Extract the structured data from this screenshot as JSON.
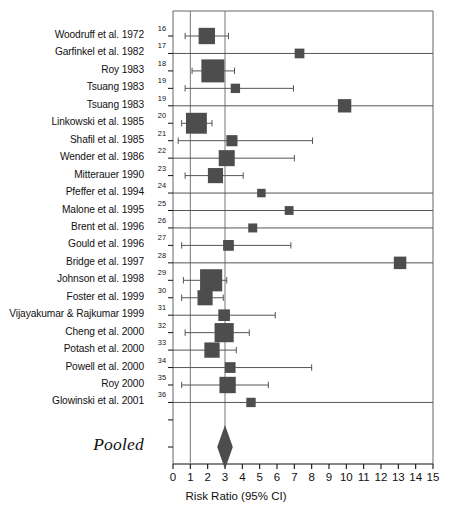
{
  "figure": {
    "kind": "forest-plot",
    "background": "#ffffff",
    "marker_color": "#4d4d4d",
    "line_color": "#555555",
    "frame_color": "#666666",
    "reference_line_color": "#777777"
  },
  "axis": {
    "title": "Risk Ratio (95% CI)",
    "min": 0,
    "max": 15,
    "ticks": [
      0,
      1,
      2,
      3,
      4,
      5,
      6,
      7,
      8,
      9,
      10,
      11,
      12,
      13,
      14,
      15
    ],
    "tick_labels": [
      "0",
      "1",
      "2",
      "3",
      "4",
      "5",
      "6",
      "7",
      "8",
      "9",
      "10",
      "11",
      "12",
      "13",
      "14",
      "15"
    ],
    "reference_lines": [
      1,
      3
    ]
  },
  "pooled": {
    "label": "Pooled",
    "estimate": 3.0,
    "ci_low": 2.55,
    "ci_high": 3.45
  },
  "chart_data": {
    "type": "scatter",
    "title": "",
    "xlabel": "Risk Ratio (95% CI)",
    "ylabel": "",
    "xlim": [
      0,
      15
    ],
    "grid": false,
    "legend": "none",
    "categories": [
      "Woodruff et al. 1972",
      "Garfinkel et al. 1982",
      "Roy 1983",
      "Tsuang 1983",
      "Tsuang 1983",
      "Linkowski et al. 1985",
      "Shafil et al. 1985",
      "Wender et al. 1986",
      "Mitterauer 1990",
      "Pfeffer et al. 1994",
      "Malone et al. 1995",
      "Brent et al. 1996",
      "Gould et al. 1996",
      "Bridge et al. 1997",
      "Johnson et al. 1998",
      "Foster et al. 1999",
      "Vijayakumar & Rajkumar 1999",
      "Cheng et al. 2000",
      "Potash et al. 2000",
      "Powell et al. 2000",
      "Roy 2000",
      "Glowinski et al. 2001"
    ],
    "rows": [
      {
        "label": "Woodruff et al. 1972",
        "ref": "16",
        "rr": 1.95,
        "ci_low": 0.7,
        "ci_high": 3.2,
        "weight": 0.62
      },
      {
        "label": "Garfinkel et al. 1982",
        "ref": "17",
        "rr": 7.3,
        "ci_low": 0.0,
        "ci_high": 15.0,
        "weight": 0.24
      },
      {
        "label": "Roy 1983",
        "ref": "18",
        "rr": 2.3,
        "ci_low": 1.1,
        "ci_high": 3.55,
        "weight": 1.0
      },
      {
        "label": "Tsuang 1983",
        "ref": "19",
        "rr": 3.6,
        "ci_low": 0.7,
        "ci_high": 6.95,
        "weight": 0.22
      },
      {
        "label": "Tsuang 1983",
        "ref": "19",
        "rr": 9.9,
        "ci_low": 0.0,
        "ci_high": 15.0,
        "weight": 0.45
      },
      {
        "label": "Linkowski et al. 1985",
        "ref": "20",
        "rr": 1.35,
        "ci_low": 0.5,
        "ci_high": 2.25,
        "weight": 0.88
      },
      {
        "label": "Shafil et al. 1985",
        "ref": "21",
        "rr": 3.4,
        "ci_low": 0.3,
        "ci_high": 8.05,
        "weight": 0.32
      },
      {
        "label": "Wender et al. 1986",
        "ref": "22",
        "rr": 3.1,
        "ci_low": 0.0,
        "ci_high": 7.0,
        "weight": 0.6
      },
      {
        "label": "Mitterauer 1990",
        "ref": "23",
        "rr": 2.45,
        "ci_low": 0.7,
        "ci_high": 4.05,
        "weight": 0.55
      },
      {
        "label": "Pfeffer et al. 1994",
        "ref": "24",
        "rr": 5.1,
        "ci_low": 0.0,
        "ci_high": 15.0,
        "weight": 0.17
      },
      {
        "label": "Malone et al. 1995",
        "ref": "25",
        "rr": 6.7,
        "ci_low": 0.0,
        "ci_high": 15.0,
        "weight": 0.19
      },
      {
        "label": "Brent et al. 1996",
        "ref": "26",
        "rr": 4.6,
        "ci_low": 0.0,
        "ci_high": 15.0,
        "weight": 0.2
      },
      {
        "label": "Gould et al. 1996",
        "ref": "27",
        "rr": 3.2,
        "ci_low": 0.5,
        "ci_high": 6.8,
        "weight": 0.3
      },
      {
        "label": "Bridge et al. 1997",
        "ref": "28",
        "rr": 13.1,
        "ci_low": 0.0,
        "ci_high": 15.0,
        "weight": 0.4
      },
      {
        "label": "Johnson et al. 1998",
        "ref": "29",
        "rr": 2.2,
        "ci_low": 0.6,
        "ci_high": 3.1,
        "weight": 0.95
      },
      {
        "label": "Foster et al. 1999",
        "ref": "30",
        "rr": 1.85,
        "ci_low": 0.5,
        "ci_high": 2.9,
        "weight": 0.55
      },
      {
        "label": "Vijayakumar & Rajkumar 1999",
        "ref": "31",
        "rr": 2.95,
        "ci_low": 0.0,
        "ci_high": 5.9,
        "weight": 0.35
      },
      {
        "label": "Cheng et al. 2000",
        "ref": "32",
        "rr": 2.95,
        "ci_low": 0.7,
        "ci_high": 4.4,
        "weight": 0.78
      },
      {
        "label": "Potash et al. 2000",
        "ref": "33",
        "rr": 2.25,
        "ci_low": 0.0,
        "ci_high": 3.65,
        "weight": 0.56
      },
      {
        "label": "Powell et al. 2000",
        "ref": "34",
        "rr": 3.3,
        "ci_low": 0.0,
        "ci_high": 8.0,
        "weight": 0.3
      },
      {
        "label": "Roy 2000",
        "ref": "35",
        "rr": 3.15,
        "ci_low": 0.5,
        "ci_high": 5.5,
        "weight": 0.62
      },
      {
        "label": "Glowinski et al. 2001",
        "ref": "36",
        "rr": 4.5,
        "ci_low": 0.0,
        "ci_high": 15.0,
        "weight": 0.22
      }
    ],
    "pooled": {
      "label": "Pooled",
      "rr": 3.0,
      "ci_low": 2.55,
      "ci_high": 3.45
    }
  }
}
